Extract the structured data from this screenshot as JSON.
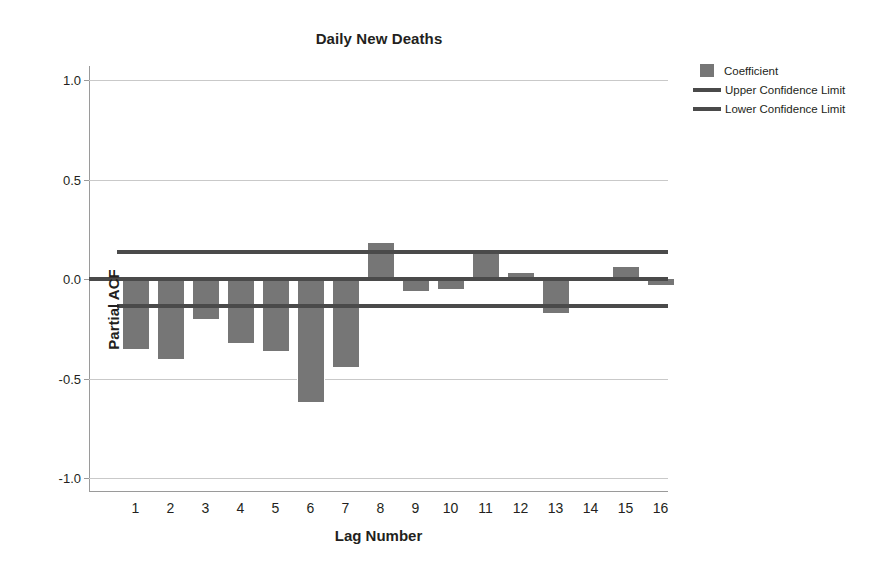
{
  "chart_data": {
    "type": "bar",
    "title": "Daily New Deaths",
    "xlabel": "Lag Number",
    "ylabel": "Partial ACF",
    "grid": true,
    "legend_position": "right",
    "ylim": [
      -1.0,
      1.0
    ],
    "ytick_labels": [
      "1.0",
      "0.5",
      "0.0",
      "-0.5",
      "-1.0"
    ],
    "ytick_values": [
      1.0,
      0.5,
      0.0,
      -0.5,
      -1.0
    ],
    "categories": [
      "1",
      "2",
      "3",
      "4",
      "5",
      "6",
      "7",
      "8",
      "9",
      "10",
      "11",
      "12",
      "13",
      "14",
      "15",
      "16"
    ],
    "series": [
      {
        "name": "Coefficient",
        "values": [
          -0.35,
          -0.4,
          -0.2,
          -0.32,
          -0.36,
          -0.62,
          -0.44,
          0.18,
          -0.06,
          -0.05,
          0.13,
          0.03,
          -0.17,
          0.0,
          0.06,
          -0.03
        ]
      }
    ],
    "upper_confidence_limit": 0.135,
    "lower_confidence_limit": -0.135,
    "colors": {
      "bar": "#767676",
      "confidence_line": "#4a4a4a",
      "zero_line": "#4a4a4a",
      "gridline": "#c9c9c9",
      "axis": "#9a9a9a",
      "text": "#231f20"
    }
  },
  "legend": {
    "items": [
      {
        "label": "Coefficient",
        "marker": "box"
      },
      {
        "label": "Upper Confidence Limit",
        "marker": "line"
      },
      {
        "label": "Lower Confidence Limit",
        "marker": "line"
      }
    ]
  }
}
